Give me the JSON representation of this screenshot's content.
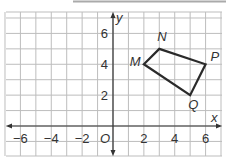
{
  "plane": {
    "x_axis_label": "x",
    "y_axis_label": "y",
    "origin_label": "O",
    "x_ticks": [
      {
        "value": -6,
        "label": "−6"
      },
      {
        "value": -4,
        "label": "−4"
      },
      {
        "value": -2,
        "label": "−2"
      },
      {
        "value": 2,
        "label": "2"
      },
      {
        "value": 4,
        "label": "4"
      },
      {
        "value": 6,
        "label": "6"
      }
    ],
    "y_ticks": [
      {
        "value": 2,
        "label": "2"
      },
      {
        "value": 4,
        "label": "4"
      },
      {
        "value": 6,
        "label": "6"
      }
    ]
  },
  "quadrilateral": {
    "vertices": [
      {
        "name": "M",
        "x": 2,
        "y": 4
      },
      {
        "name": "N",
        "x": 3,
        "y": 5
      },
      {
        "name": "P",
        "x": 6,
        "y": 4
      },
      {
        "name": "Q",
        "x": 5,
        "y": 2
      }
    ],
    "labels": {
      "M": "M",
      "N": "N",
      "P": "P",
      "Q": "Q"
    }
  }
}
